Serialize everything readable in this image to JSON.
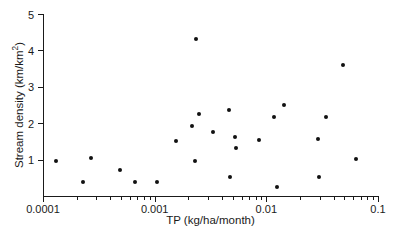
{
  "chart_data": {
    "type": "scatter",
    "title": "",
    "xlabel": "TP (kg/ha/month)",
    "ylabel_text": "Stream density (km/km",
    "ylabel_sup": "2",
    "ylabel_tail": ")",
    "ylabel_full": "Stream density (km/km2)",
    "x_scale": "log",
    "y_scale": "linear",
    "xlim": [
      0.0001,
      0.1
    ],
    "ylim": [
      0,
      5
    ],
    "grid": false,
    "legend": null,
    "x_tick_labels": [
      "0.0001",
      "0.001",
      "0.01",
      "0.1"
    ],
    "x_tick_values": [
      0.0001,
      0.001,
      0.01,
      0.1
    ],
    "x_minor_ticks": [
      0.0002,
      0.0003,
      0.0004,
      0.0005,
      0.0006,
      0.0007,
      0.0008,
      0.0009,
      0.002,
      0.003,
      0.004,
      0.005,
      0.006,
      0.007,
      0.008,
      0.009,
      0.02,
      0.03,
      0.04,
      0.05,
      0.06,
      0.07,
      0.08,
      0.09
    ],
    "y_tick_labels": [
      "1",
      "2",
      "3",
      "4",
      "5"
    ],
    "y_tick_values": [
      1,
      2,
      3,
      4,
      5
    ],
    "points": [
      {
        "x": 0.00013,
        "y": 0.95
      },
      {
        "x": 0.00023,
        "y": 0.38
      },
      {
        "x": 0.00027,
        "y": 1.05
      },
      {
        "x": 0.00049,
        "y": 0.72
      },
      {
        "x": 0.00066,
        "y": 0.38
      },
      {
        "x": 0.00105,
        "y": 0.39
      },
      {
        "x": 0.00155,
        "y": 1.5
      },
      {
        "x": 0.00215,
        "y": 1.93
      },
      {
        "x": 0.0023,
        "y": 0.96
      },
      {
        "x": 0.00235,
        "y": 4.31
      },
      {
        "x": 0.0025,
        "y": 2.25
      },
      {
        "x": 0.0033,
        "y": 1.76
      },
      {
        "x": 0.0046,
        "y": 2.36
      },
      {
        "x": 0.0047,
        "y": 0.52
      },
      {
        "x": 0.0052,
        "y": 1.62
      },
      {
        "x": 0.0053,
        "y": 1.33
      },
      {
        "x": 0.0086,
        "y": 1.55
      },
      {
        "x": 0.0124,
        "y": 0.25
      },
      {
        "x": 0.0118,
        "y": 2.16
      },
      {
        "x": 0.0145,
        "y": 2.5
      },
      {
        "x": 0.0293,
        "y": 1.57
      },
      {
        "x": 0.0298,
        "y": 0.52
      },
      {
        "x": 0.0342,
        "y": 2.16
      },
      {
        "x": 0.0485,
        "y": 3.6
      },
      {
        "x": 0.063,
        "y": 1.03
      }
    ]
  }
}
